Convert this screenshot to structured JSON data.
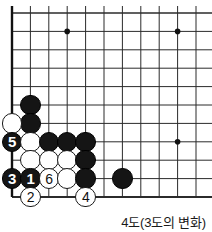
{
  "diagram": {
    "type": "go-board-diagram",
    "caption": "4도(3도의 변화)",
    "board": {
      "visible_columns": 11,
      "visible_rows": 11,
      "corner": "bottom-left",
      "line_color": "#2b2b2b",
      "edge_color": "#111111",
      "background_color": "#ffffff",
      "origin_x": 12,
      "origin_y": 13,
      "spacing": 18.4,
      "star_points": [
        {
          "col": 3,
          "row": 1
        },
        {
          "col": 9,
          "row": 1
        },
        {
          "col": 9,
          "row": 7
        }
      ]
    },
    "stones": [
      {
        "col": 1,
        "row": 5,
        "color": "black",
        "label": "",
        "name": "stone-black-c1r5"
      },
      {
        "col": 1,
        "row": 6,
        "color": "black",
        "label": "",
        "name": "stone-black-c1r6"
      },
      {
        "col": 0,
        "row": 6,
        "color": "white",
        "label": "",
        "name": "stone-white-c0r6"
      },
      {
        "col": 0,
        "row": 7,
        "color": "black",
        "label": "5",
        "name": "stone-black-move-5"
      },
      {
        "col": 1,
        "row": 7,
        "color": "white",
        "label": "",
        "name": "stone-white-c1r7"
      },
      {
        "col": 2,
        "row": 7,
        "color": "black",
        "label": "",
        "name": "stone-black-c2r7"
      },
      {
        "col": 3,
        "row": 7,
        "color": "black",
        "label": "",
        "name": "stone-black-c3r7"
      },
      {
        "col": 4,
        "row": 7,
        "color": "black",
        "label": "",
        "name": "stone-black-c4r7"
      },
      {
        "col": 1,
        "row": 8,
        "color": "white",
        "label": "",
        "name": "stone-white-c1r8"
      },
      {
        "col": 2,
        "row": 8,
        "color": "white",
        "label": "",
        "name": "stone-white-c2r8"
      },
      {
        "col": 3,
        "row": 8,
        "color": "white",
        "label": "",
        "name": "stone-white-c3r8"
      },
      {
        "col": 4,
        "row": 8,
        "color": "black",
        "label": "",
        "name": "stone-black-c4r8"
      },
      {
        "col": 0,
        "row": 9,
        "color": "black",
        "label": "3",
        "name": "stone-black-move-3"
      },
      {
        "col": 1,
        "row": 9,
        "color": "black",
        "label": "1",
        "name": "stone-black-move-1"
      },
      {
        "col": 2,
        "row": 9,
        "color": "white",
        "label": "6",
        "name": "stone-white-move-6"
      },
      {
        "col": 3,
        "row": 9,
        "color": "white",
        "label": "",
        "name": "stone-white-c3r9"
      },
      {
        "col": 4,
        "row": 9,
        "color": "black",
        "label": "",
        "name": "stone-black-c4r9"
      },
      {
        "col": 6,
        "row": 9,
        "color": "black",
        "label": "",
        "name": "stone-black-c6r9"
      },
      {
        "col": 1,
        "row": 10,
        "color": "white",
        "label": "2",
        "name": "stone-white-move-2"
      },
      {
        "col": 4,
        "row": 10,
        "color": "white",
        "label": "4",
        "name": "stone-white-move-4"
      }
    ]
  }
}
